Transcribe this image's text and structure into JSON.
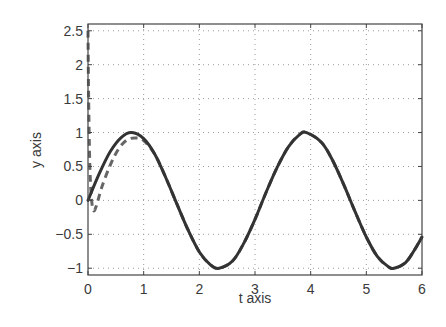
{
  "chart_data": {
    "type": "line",
    "title": "",
    "xlabel": "t axis",
    "ylabel": "y axis",
    "xlim": [
      0,
      6
    ],
    "ylim": [
      -1.1,
      2.6
    ],
    "grid": true,
    "legend": null,
    "xticks": [
      0,
      1,
      2,
      3,
      4,
      5,
      6
    ],
    "xtick_labels": [
      "0",
      "1",
      "2",
      "3",
      "4",
      "5",
      "6"
    ],
    "yticks": [
      -1,
      -0.5,
      0,
      0.5,
      1,
      1.5,
      2,
      2.5
    ],
    "ytick_labels": [
      "−1",
      "−0.5",
      "0",
      "0.5",
      "1",
      "1.5",
      "2",
      "2.5"
    ],
    "series": [
      {
        "name": "solid",
        "style": "solid",
        "color": "#333333",
        "x": [
          0,
          0.2,
          0.4,
          0.6,
          0.785,
          1.0,
          1.2,
          1.4,
          1.6,
          1.8,
          2.0,
          2.2,
          2.356,
          2.6,
          2.8,
          3.0,
          3.2,
          3.4,
          3.6,
          3.8,
          3.927,
          4.2,
          4.4,
          4.6,
          4.8,
          5.0,
          5.2,
          5.4,
          5.498,
          5.7,
          5.85,
          6.0
        ],
        "y": [
          0,
          0.39,
          0.72,
          0.93,
          1.0,
          0.91,
          0.68,
          0.33,
          -0.06,
          -0.44,
          -0.76,
          -0.95,
          -1.0,
          -0.89,
          -0.63,
          -0.28,
          0.12,
          0.49,
          0.79,
          0.97,
          1.0,
          0.85,
          0.58,
          0.22,
          -0.17,
          -0.54,
          -0.83,
          -0.98,
          -1.0,
          -0.92,
          -0.75,
          -0.54
        ]
      },
      {
        "name": "dashed",
        "style": "dashed",
        "color": "#666666",
        "x": [
          0,
          0.01,
          0.03,
          0.06,
          0.1,
          0.15,
          0.25,
          0.4,
          0.55,
          0.7,
          0.85,
          1.0,
          1.2,
          1.4,
          1.6,
          1.8,
          2.0,
          2.2,
          2.356,
          2.6,
          2.8,
          3.0,
          3.2,
          3.4,
          3.6,
          3.8,
          3.927,
          4.2,
          4.4,
          4.6,
          4.8,
          5.0,
          5.2,
          5.4,
          5.498,
          5.7,
          5.85,
          6.0
        ],
        "y": [
          2.5,
          1.6,
          0.6,
          0.05,
          -0.15,
          -0.08,
          0.2,
          0.52,
          0.76,
          0.89,
          0.92,
          0.88,
          0.68,
          0.33,
          -0.06,
          -0.44,
          -0.76,
          -0.95,
          -1.0,
          -0.89,
          -0.63,
          -0.28,
          0.12,
          0.49,
          0.79,
          0.97,
          1.0,
          0.85,
          0.58,
          0.22,
          -0.17,
          -0.54,
          -0.83,
          -0.98,
          -1.0,
          -0.92,
          -0.75,
          -0.54
        ]
      }
    ]
  },
  "plot_area": {
    "left": 88,
    "top": 24,
    "right": 422,
    "bottom": 275
  }
}
